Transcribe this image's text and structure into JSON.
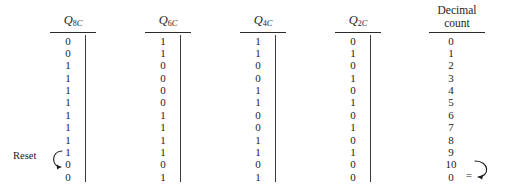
{
  "figure": {
    "type": "truth-table",
    "title": ""
  },
  "columns": [
    {
      "id": "q8c",
      "header_symbol": "Q",
      "header_subscript": "8",
      "header_suffix": "C",
      "header_text": "Q8C",
      "values": [
        "0",
        "0",
        "1",
        "1",
        "1",
        "1",
        "1",
        "1",
        "1",
        "1",
        "0",
        "0"
      ]
    },
    {
      "id": "q6c",
      "header_symbol": "Q",
      "header_subscript": "6",
      "header_suffix": "C",
      "header_text": "Q6C",
      "values": [
        "1",
        "1",
        "0",
        "0",
        "0",
        "0",
        "1",
        "1",
        "1",
        "1",
        "0",
        "1"
      ]
    },
    {
      "id": "q4c",
      "header_symbol": "Q",
      "header_subscript": "4",
      "header_suffix": "C",
      "header_text": "Q4C",
      "values": [
        "1",
        "1",
        "0",
        "0",
        "1",
        "1",
        "0",
        "0",
        "1",
        "1",
        "0",
        "1"
      ]
    },
    {
      "id": "q2c",
      "header_symbol": "Q",
      "header_subscript": "2",
      "header_suffix": "C",
      "header_text": "Q2C",
      "values": [
        "0",
        "1",
        "0",
        "1",
        "0",
        "1",
        "0",
        "1",
        "0",
        "1",
        "0",
        "0"
      ]
    },
    {
      "id": "decimal",
      "header_line1": "Decimal",
      "header_line2": "count",
      "header_text": "Decimal count",
      "values": [
        "0",
        "1",
        "2",
        "3",
        "4",
        "5",
        "6",
        "7",
        "8",
        "9",
        "10",
        "0"
      ]
    }
  ],
  "annotations": {
    "reset_label": "Reset",
    "wrap_equals": "=",
    "reset_arrow_icon": "curved-arrow-icon",
    "wrap_arrow_icon": "curved-arrow-icon"
  },
  "colors": {
    "background": "#ffffff",
    "text": "#1b1b1b",
    "rule": "#2a2a2a"
  }
}
